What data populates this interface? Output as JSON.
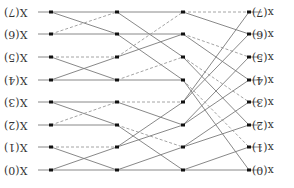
{
  "diagram": {
    "colors": {
      "solid_edge": "#7a7a7a",
      "dashed_edge": "#9a9a9a",
      "node": "#111111",
      "label": "#333333"
    },
    "left_labels": [
      "X(7)",
      "X(6)",
      "X(5)",
      "X(4)",
      "X(3)",
      "X(2)",
      "X(1)",
      "X(0)"
    ],
    "right_labels": [
      "x(7)",
      "x(6)",
      "x(5)",
      "x(4)",
      "x(3)",
      "x(2)",
      "x(1)",
      "x(0)"
    ],
    "rows_y": [
      12,
      34,
      57,
      80,
      102,
      125,
      147,
      170
    ],
    "columns_x": [
      51,
      117,
      183,
      249
    ],
    "stages": [
      {
        "name": "stage-1",
        "edges": [
          {
            "from": 0,
            "to": 0,
            "style": "solid"
          },
          {
            "from": 0,
            "to": 1,
            "style": "solid"
          },
          {
            "from": 1,
            "to": 1,
            "style": "solid"
          },
          {
            "from": 1,
            "to": 0,
            "style": "dashed"
          },
          {
            "from": 2,
            "to": 2,
            "style": "dashed"
          },
          {
            "from": 2,
            "to": 3,
            "style": "solid"
          },
          {
            "from": 3,
            "to": 3,
            "style": "solid"
          },
          {
            "from": 3,
            "to": 2,
            "style": "solid"
          },
          {
            "from": 4,
            "to": 4,
            "style": "solid"
          },
          {
            "from": 4,
            "to": 5,
            "style": "solid"
          },
          {
            "from": 5,
            "to": 5,
            "style": "solid"
          },
          {
            "from": 5,
            "to": 4,
            "style": "dashed"
          },
          {
            "from": 6,
            "to": 6,
            "style": "dashed"
          },
          {
            "from": 6,
            "to": 7,
            "style": "solid"
          },
          {
            "from": 7,
            "to": 7,
            "style": "solid"
          },
          {
            "from": 7,
            "to": 6,
            "style": "solid"
          }
        ]
      },
      {
        "name": "stage-2",
        "edges": [
          {
            "from": 0,
            "to": 0,
            "style": "solid"
          },
          {
            "from": 0,
            "to": 2,
            "style": "solid"
          },
          {
            "from": 1,
            "to": 1,
            "style": "solid"
          },
          {
            "from": 1,
            "to": 3,
            "style": "solid"
          },
          {
            "from": 2,
            "to": 0,
            "style": "dashed"
          },
          {
            "from": 2,
            "to": 1,
            "style": "solid"
          },
          {
            "from": 3,
            "to": 3,
            "style": "solid"
          },
          {
            "from": 3,
            "to": 2,
            "style": "dashed"
          },
          {
            "from": 4,
            "to": 4,
            "style": "dashed"
          },
          {
            "from": 4,
            "to": 5,
            "style": "solid"
          },
          {
            "from": 5,
            "to": 7,
            "style": "solid"
          },
          {
            "from": 5,
            "to": 6,
            "style": "dashed"
          },
          {
            "from": 6,
            "to": 4,
            "style": "solid"
          },
          {
            "from": 6,
            "to": 5,
            "style": "solid"
          },
          {
            "from": 7,
            "to": 7,
            "style": "solid"
          },
          {
            "from": 7,
            "to": 6,
            "style": "solid"
          }
        ]
      },
      {
        "name": "stage-3",
        "edges": [
          {
            "from": 0,
            "to": 0,
            "style": "dashed"
          },
          {
            "from": 0,
            "to": 1,
            "style": "solid"
          },
          {
            "from": 1,
            "to": 2,
            "style": "dashed"
          },
          {
            "from": 1,
            "to": 3,
            "style": "solid"
          },
          {
            "from": 2,
            "to": 4,
            "style": "dashed"
          },
          {
            "from": 2,
            "to": 5,
            "style": "solid"
          },
          {
            "from": 3,
            "to": 6,
            "style": "dashed"
          },
          {
            "from": 3,
            "to": 7,
            "style": "solid"
          },
          {
            "from": 4,
            "to": 0,
            "style": "solid"
          },
          {
            "from": 4,
            "to": 1,
            "style": "solid"
          },
          {
            "from": 5,
            "to": 2,
            "style": "solid"
          },
          {
            "from": 5,
            "to": 3,
            "style": "solid"
          },
          {
            "from": 6,
            "to": 4,
            "style": "solid"
          },
          {
            "from": 6,
            "to": 5,
            "style": "solid"
          },
          {
            "from": 7,
            "to": 6,
            "style": "solid"
          },
          {
            "from": 7,
            "to": 7,
            "style": "solid"
          }
        ]
      }
    ],
    "io_stub": {
      "left_x1": 38,
      "left_x2": 51,
      "right_x1": 249,
      "right_x2": 262
    }
  }
}
